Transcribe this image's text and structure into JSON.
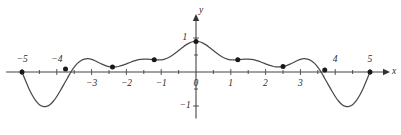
{
  "figure": {
    "background_color": "#ffffff",
    "curve_color": "#4a4a4a",
    "axis_color": "#444444",
    "marker_color": "#1a1a1a"
  },
  "axes": {
    "x_axis_name": "x",
    "y_axis_name": "y",
    "origin_label": "0"
  },
  "x_ticks": [
    {
      "value": -5,
      "label": "−5",
      "position": "above"
    },
    {
      "value": -4,
      "label": "−4",
      "position": "above"
    },
    {
      "value": -3,
      "label": "−3",
      "position": "below"
    },
    {
      "value": -2,
      "label": "−2",
      "position": "below"
    },
    {
      "value": -1,
      "label": "−1",
      "position": "below"
    },
    {
      "value": 0,
      "label": "0",
      "position": "below"
    },
    {
      "value": 1,
      "label": "1",
      "position": "below"
    },
    {
      "value": 2,
      "label": "2",
      "position": "below"
    },
    {
      "value": 3,
      "label": "3",
      "position": "below"
    },
    {
      "value": 4,
      "label": "4",
      "position": "above"
    },
    {
      "value": 5,
      "label": "5",
      "position": "above"
    }
  ],
  "y_ticks": [
    {
      "value": 1,
      "label": "1"
    },
    {
      "value": -1,
      "label": "−1"
    }
  ],
  "chart_data": {
    "type": "line",
    "title": "",
    "subtitle": "",
    "xlabel": "x",
    "ylabel": "y",
    "xlim": [
      -5.4,
      5.4
    ],
    "ylim": [
      -1.25,
      1.15
    ],
    "grid": false,
    "legend": "none",
    "x_tick_values": [
      -5,
      -4,
      -3,
      -2,
      -1,
      0,
      1,
      2,
      3,
      4,
      5
    ],
    "y_tick_values": [
      -1,
      1
    ],
    "minor_tick_step": 0.5,
    "series": [
      {
        "name": "curve",
        "style": "solid-smooth",
        "x": [
          -5.0,
          -4.9,
          -4.8,
          -4.7,
          -4.6,
          -4.5,
          -4.4,
          -4.3,
          -4.2,
          -4.1,
          -4.0,
          -3.9,
          -3.8,
          -3.7,
          -3.6,
          -3.5,
          -3.4,
          -3.3,
          -3.2,
          -3.1,
          -3.0,
          -2.9,
          -2.8,
          -2.7,
          -2.6,
          -2.5,
          -2.4,
          -2.3,
          -2.2,
          -2.1,
          -2.0,
          -1.9,
          -1.8,
          -1.7,
          -1.6,
          -1.5,
          -1.4,
          -1.3,
          -1.2,
          -1.1,
          -1.0,
          -0.9,
          -0.8,
          -0.7,
          -0.6,
          -0.5,
          -0.4,
          -0.3,
          -0.2,
          -0.1,
          0.0,
          0.1,
          0.2,
          0.3,
          0.4,
          0.5,
          0.6,
          0.7,
          0.8,
          0.9,
          1.0,
          1.1,
          1.2,
          1.3,
          1.4,
          1.5,
          1.6,
          1.7,
          1.8,
          1.9,
          2.0,
          2.1,
          2.2,
          2.3,
          2.4,
          2.5,
          2.6,
          2.7,
          2.8,
          2.9,
          3.0,
          3.1,
          3.2,
          3.3,
          3.4,
          3.5,
          3.6,
          3.7,
          3.8,
          3.9,
          4.0,
          4.1,
          4.2,
          4.3,
          4.4,
          4.5,
          4.6,
          4.7,
          4.8,
          4.9,
          5.0
        ],
        "y": [
          0.0,
          -0.25,
          -0.49,
          -0.69,
          -0.85,
          -0.96,
          -1.01,
          -1.01,
          -0.96,
          -0.86,
          -0.72,
          -0.55,
          -0.37,
          -0.19,
          -0.01,
          0.14,
          0.26,
          0.34,
          0.38,
          0.39,
          0.37,
          0.33,
          0.28,
          0.23,
          0.19,
          0.16,
          0.15,
          0.15,
          0.17,
          0.2,
          0.24,
          0.28,
          0.32,
          0.35,
          0.37,
          0.38,
          0.38,
          0.37,
          0.36,
          0.36,
          0.36,
          0.38,
          0.42,
          0.48,
          0.55,
          0.63,
          0.71,
          0.79,
          0.85,
          0.89,
          0.9,
          0.89,
          0.85,
          0.79,
          0.71,
          0.63,
          0.55,
          0.48,
          0.42,
          0.38,
          0.36,
          0.36,
          0.36,
          0.37,
          0.38,
          0.38,
          0.37,
          0.35,
          0.32,
          0.28,
          0.24,
          0.2,
          0.17,
          0.15,
          0.15,
          0.16,
          0.19,
          0.23,
          0.28,
          0.33,
          0.37,
          0.39,
          0.38,
          0.34,
          0.26,
          0.14,
          -0.01,
          -0.19,
          -0.37,
          -0.55,
          -0.72,
          -0.86,
          -0.96,
          -1.01,
          -1.01,
          -0.96,
          -0.85,
          -0.69,
          -0.49,
          -0.25,
          0.0
        ]
      }
    ],
    "markers": [
      {
        "x": -5.0,
        "y": 0.0
      },
      {
        "x": -3.75,
        "y": 0.09
      },
      {
        "x": -2.4,
        "y": 0.15
      },
      {
        "x": -1.2,
        "y": 0.36
      },
      {
        "x": 0.0,
        "y": 0.9
      },
      {
        "x": 1.2,
        "y": 0.36
      },
      {
        "x": 2.5,
        "y": 0.16
      },
      {
        "x": 3.7,
        "y": 0.06
      },
      {
        "x": 5.0,
        "y": 0.0
      }
    ],
    "annotations": []
  }
}
